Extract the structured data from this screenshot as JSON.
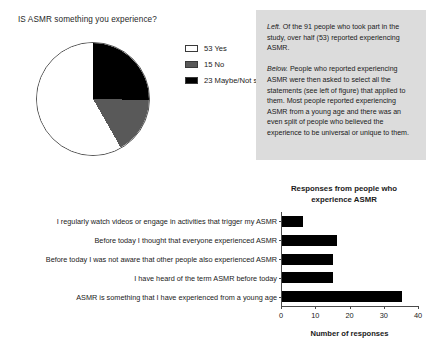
{
  "pie_section": {
    "heading": "IS ASMR something you experience?",
    "legend": [
      {
        "label": "53 Yes",
        "swatch": "white-swatch-icon",
        "value": 53,
        "color": "#ffffff"
      },
      {
        "label": "15 No",
        "swatch": "gray-swatch-icon",
        "value": 15,
        "color": "#595959"
      },
      {
        "label": "23 Maybe/Not sure",
        "swatch": "black-swatch-icon",
        "value": 23,
        "color": "#000000"
      }
    ]
  },
  "caption": {
    "paragraph_1_lead": "Left.",
    "paragraph_1_text": " Of the 91 people who took part in the study, over half (53) reported experiencing ASMR.",
    "paragraph_2_lead": "Below.",
    "paragraph_2_text": " People who reported experiencing ASMR were then asked to select all the statements (see left of figure) that applied to them. Most people reported experiencing ASMR from a young age and there was an even split of people who believed the experience to be universal or unique to them.",
    "background_color": "#dcdcdc"
  },
  "bar_section": {
    "title_line_1": "Responses from people who",
    "title_line_2": "experience ASMR"
  },
  "chart_data": [
    {
      "type": "pie",
      "title": "IS ASMR something you experience?",
      "categories": [
        "Yes",
        "No",
        "Maybe/Not sure"
      ],
      "values": [
        53,
        15,
        23
      ],
      "total": 91,
      "colors": [
        "#ffffff",
        "#595959",
        "#000000"
      ],
      "legend_labels": [
        "53 Yes",
        "15 No",
        "23 Maybe/Not sure"
      ],
      "legend_position": "right",
      "start_angle_deg": 0,
      "direction": "clockwise"
    },
    {
      "type": "bar",
      "orientation": "horizontal",
      "title": "Responses from people who experience ASMR",
      "xlabel": "Number of responses",
      "ylabel": "",
      "xlim": [
        0,
        40
      ],
      "xticks": [
        0,
        10,
        20,
        30,
        40
      ],
      "grid": false,
      "bar_color": "#000000",
      "categories": [
        "I regularly watch videos or engage in activities that trigger my ASMR",
        "Before today I thought that everyone experienced ASMR",
        "Before today I was not aware that other people also experienced ASMR",
        "I have heard of the term ASMR before today",
        "ASMR is something that I have experienced from a young age"
      ],
      "values": [
        6,
        16,
        15,
        15,
        35
      ]
    }
  ]
}
